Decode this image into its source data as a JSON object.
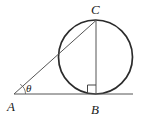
{
  "figure": {
    "background_color": "#ffffff",
    "stroke_color": "#2b2b2b",
    "thin_stroke_color": "#555555",
    "width": 141,
    "height": 119,
    "labels": {
      "point_a": "A",
      "point_b": "B",
      "point_c": "C",
      "angle_theta": "θ"
    },
    "points": {
      "A": {
        "x": 14,
        "y": 94
      },
      "B": {
        "x": 96,
        "y": 94
      },
      "C": {
        "x": 96,
        "y": 20
      }
    },
    "circle": {
      "cx": 95.5,
      "cy": 57,
      "r": 37,
      "stroke_width": 1.6
    },
    "segments": [
      {
        "name": "baseline-AB",
        "x1": 14,
        "y1": 94,
        "x2": 133,
        "y2": 94
      },
      {
        "name": "tangent-AC",
        "x1": 14,
        "y1": 94,
        "x2": 96,
        "y2": 20
      },
      {
        "name": "chord-CB",
        "x1": 96,
        "y1": 20,
        "x2": 96,
        "y2": 94
      }
    ],
    "right_angle_marker": {
      "x": 88,
      "y": 85,
      "size": 9
    },
    "angle_arc": {
      "cx": 14,
      "cy": 94,
      "r": 11
    },
    "label_positions": {
      "A": {
        "x": 12,
        "y": 108
      },
      "B": {
        "x": 92,
        "y": 112
      },
      "C": {
        "x": 92,
        "y": 13
      },
      "theta": {
        "x": 27,
        "y": 92
      }
    }
  }
}
